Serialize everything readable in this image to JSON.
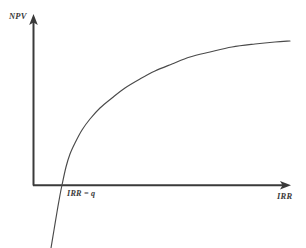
{
  "figure": {
    "background_color": "#ffffff",
    "width": 306,
    "height": 248,
    "top_cut_text": "p g p p y",
    "axis_color": "#3a3a3a",
    "curve_color": "#4a4a4a",
    "label_color": "#3b3b3b"
  },
  "labels": {
    "y_axis": "NPV",
    "x_axis": "IRR",
    "intercept": "IRR = q"
  },
  "chart_data": {
    "type": "line",
    "title": "",
    "xlabel": "IRR",
    "ylabel": "NPV",
    "grid": false,
    "legend": "none",
    "annotations": [
      {
        "text": "IRR = q",
        "x_px": 67,
        "y_px": 190,
        "describes": "x-intercept where NPV equals zero"
      }
    ],
    "axes": {
      "y_axis_x_px": 33,
      "x_axis_y_px": 185,
      "y_axis_top_px": 18,
      "x_axis_right_px": 290,
      "y_arrowhead": "up",
      "x_arrowhead": "right",
      "origin_px": [
        33,
        185
      ]
    },
    "series": [
      {
        "name": "NPV curve",
        "shape": "concave-down increasing",
        "x_intercept_px": 62,
        "points_px": [
          [
            51,
            248
          ],
          [
            54,
            230
          ],
          [
            57,
            212
          ],
          [
            60,
            195
          ],
          [
            62,
            185
          ],
          [
            66,
            167
          ],
          [
            70,
            154
          ],
          [
            75,
            143
          ],
          [
            82,
            130
          ],
          [
            90,
            119
          ],
          [
            100,
            108
          ],
          [
            112,
            98
          ],
          [
            125,
            88
          ],
          [
            140,
            79
          ],
          [
            155,
            71
          ],
          [
            172,
            64
          ],
          [
            190,
            57
          ],
          [
            210,
            52
          ],
          [
            232,
            47
          ],
          [
            255,
            44
          ],
          [
            275,
            42
          ],
          [
            290,
            41
          ]
        ]
      }
    ]
  }
}
